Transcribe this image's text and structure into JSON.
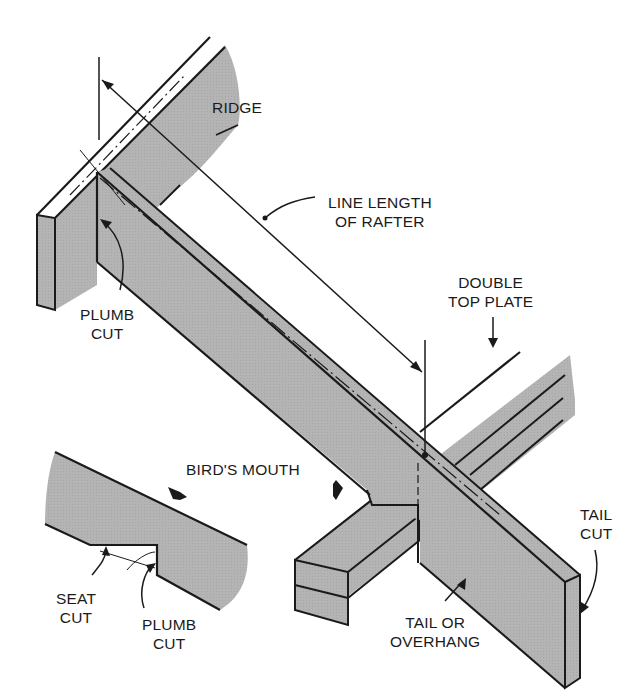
{
  "figure": {
    "type": "technical-illustration",
    "colors": {
      "wood_fill": "#b4b4b4",
      "outline": "#1a1a1a",
      "background": "#ffffff"
    }
  },
  "labels": {
    "ridge": "RIDGE",
    "line_length": "LINE LENGTH\nOF RAFTER",
    "plumb_cut_top": "PLUMB\nCUT",
    "double_top_plate": "DOUBLE\nTOP PLATE",
    "birds_mouth": "BIRD'S MOUTH",
    "seat_cut": "SEAT\nCUT",
    "plumb_cut_detail": "PLUMB\nCUT",
    "tail_cut": "TAIL\nCUT",
    "tail_overhang": "TAIL OR\nOVERHANG"
  }
}
